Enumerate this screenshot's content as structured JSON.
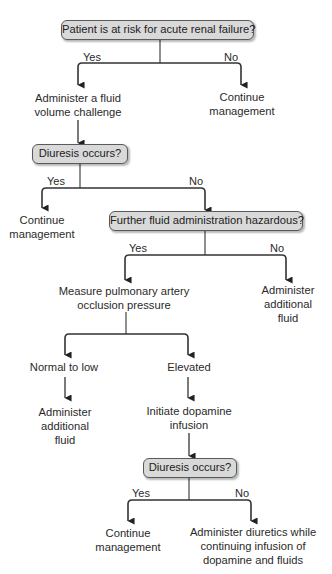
{
  "diagram": {
    "type": "flowchart",
    "line_color": "#333333",
    "decision_fill": "#d9d9d9",
    "decision_border": "#5a5a5a",
    "decisions": [
      {
        "id": "d1",
        "label": "Patient is at risk for acute renal failure?"
      },
      {
        "id": "d2",
        "label": "Diuresis occurs?"
      },
      {
        "id": "d3",
        "label": "Further fluid administration hazardous?"
      },
      {
        "id": "d4",
        "label": "Diuresis occurs?"
      }
    ],
    "actions": [
      {
        "id": "a1",
        "lines": [
          "Administer a fluid",
          "volume challenge"
        ]
      },
      {
        "id": "a2",
        "lines": [
          "Continue",
          "management"
        ]
      },
      {
        "id": "a3",
        "lines": [
          "Continue",
          "management"
        ]
      },
      {
        "id": "a4",
        "lines": [
          "Measure pulmonary artery",
          "occlusion pressure"
        ]
      },
      {
        "id": "a5",
        "lines": [
          "Administer",
          "additional",
          "fluid"
        ]
      },
      {
        "id": "a6",
        "lines": [
          "Normal to low"
        ]
      },
      {
        "id": "a7",
        "lines": [
          "Elevated"
        ]
      },
      {
        "id": "a8",
        "lines": [
          "Administer",
          "additional",
          "fluid"
        ]
      },
      {
        "id": "a9",
        "lines": [
          "Initiate dopamine",
          "infusion"
        ]
      },
      {
        "id": "a10",
        "lines": [
          "Continue",
          "management"
        ]
      },
      {
        "id": "a11",
        "lines": [
          "Administer diuretics while",
          "continuing infusion of",
          "dopamine and fluids"
        ]
      }
    ],
    "branch_labels": {
      "yes": "Yes",
      "no": "No"
    },
    "edges": [
      {
        "from": "d1",
        "to": "a1",
        "label": "Yes"
      },
      {
        "from": "d1",
        "to": "a2",
        "label": "No"
      },
      {
        "from": "a1",
        "to": "d2"
      },
      {
        "from": "d2",
        "to": "a3",
        "label": "Yes"
      },
      {
        "from": "d2",
        "to": "d3",
        "label": "No"
      },
      {
        "from": "d3",
        "to": "a4",
        "label": "Yes"
      },
      {
        "from": "d3",
        "to": "a5",
        "label": "No"
      },
      {
        "from": "a4",
        "to": "a6"
      },
      {
        "from": "a4",
        "to": "a7"
      },
      {
        "from": "a6",
        "to": "a8"
      },
      {
        "from": "a7",
        "to": "a9"
      },
      {
        "from": "a9",
        "to": "d4"
      },
      {
        "from": "d4",
        "to": "a10",
        "label": "Yes"
      },
      {
        "from": "d4",
        "to": "a11",
        "label": "No"
      }
    ]
  }
}
